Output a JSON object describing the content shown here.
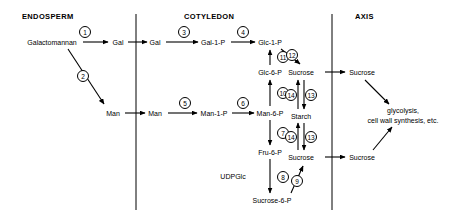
{
  "diagram": {
    "title_bar": {
      "compartments": [
        {
          "id": "endosperm",
          "label": "ENDOSPERM",
          "x": 22,
          "y": 12
        },
        {
          "id": "cotyledon",
          "label": "COTYLEDON",
          "x": 184,
          "y": 12
        },
        {
          "id": "axis",
          "label": "AXIS",
          "x": 355,
          "y": 12
        }
      ]
    },
    "dividers": [
      {
        "id": "endosperm-cotyledon-divider",
        "x": 136,
        "y1": 14,
        "y2": 210
      },
      {
        "id": "cotyledon-axis-divider",
        "x": 332,
        "y1": 14,
        "y2": 210
      }
    ],
    "nodes": [
      {
        "id": "galactomannan",
        "label": "Galactomannan",
        "x": 52,
        "y": 42
      },
      {
        "id": "gal-endosperm",
        "label": "Gal",
        "x": 118,
        "y": 42
      },
      {
        "id": "gal-cotyledon",
        "label": "Gal",
        "x": 155,
        "y": 42
      },
      {
        "id": "gal-1-p",
        "label": "Gal-1-P",
        "x": 213,
        "y": 42
      },
      {
        "id": "glc-1-p",
        "label": "Glc-1-P",
        "x": 270,
        "y": 42
      },
      {
        "id": "man-endosperm",
        "label": "Man",
        "x": 113,
        "y": 113
      },
      {
        "id": "man-cotyledon",
        "label": "Man",
        "x": 155,
        "y": 113
      },
      {
        "id": "man-1-p",
        "label": "Man-1-P",
        "x": 214,
        "y": 113
      },
      {
        "id": "man-6-p",
        "label": "Man-6-P",
        "x": 270,
        "y": 113
      },
      {
        "id": "glc-6-p",
        "label": "Glc-6-P",
        "x": 270,
        "y": 72
      },
      {
        "id": "fru-6-p",
        "label": "Fru-6-P",
        "x": 270,
        "y": 152
      },
      {
        "id": "udpglc",
        "label": "UDPGlc",
        "x": 233,
        "y": 176
      },
      {
        "id": "sucrose-6-p",
        "label": "Sucrose-6-P",
        "x": 272,
        "y": 200
      },
      {
        "id": "sucrose-cotyledon-top",
        "label": "Sucrose",
        "x": 301,
        "y": 72
      },
      {
        "id": "starch",
        "label": "Starch",
        "x": 301,
        "y": 116
      },
      {
        "id": "sucrose-cotyledon-bottom",
        "label": "Sucrose",
        "x": 301,
        "y": 157
      },
      {
        "id": "sucrose-axis-top",
        "label": "Sucrose",
        "x": 362,
        "y": 72
      },
      {
        "id": "sucrose-axis-bottom",
        "label": "Sucrose",
        "x": 362,
        "y": 157
      }
    ],
    "sink_label": {
      "id": "glycolysis-sink",
      "line1": "glycolysis,",
      "line2": "cell wall synthesis, etc.",
      "x": 403,
      "y": 115
    },
    "reactions": [
      {
        "n": "1",
        "x": 85,
        "y": 32
      },
      {
        "n": "2",
        "x": 83,
        "y": 76
      },
      {
        "n": "3",
        "x": 184,
        "y": 32
      },
      {
        "n": "4",
        "x": 243,
        "y": 32
      },
      {
        "n": "5",
        "x": 185,
        "y": 103
      },
      {
        "n": "6",
        "x": 243,
        "y": 103
      },
      {
        "n": "7",
        "x": 283,
        "y": 133
      },
      {
        "n": "8",
        "x": 283,
        "y": 177
      },
      {
        "n": "9",
        "x": 297,
        "y": 181
      },
      {
        "n": "10",
        "x": 283,
        "y": 93
      },
      {
        "n": "11",
        "x": 283,
        "y": 57
      },
      {
        "n": "12",
        "x": 292,
        "y": 55
      },
      {
        "n": "13",
        "x": 311,
        "y": 95
      },
      {
        "n": "14",
        "x": 291,
        "y": 95
      },
      {
        "n": "13b",
        "label": "13",
        "x": 311,
        "y": 137
      },
      {
        "n": "14b",
        "label": "14",
        "x": 291,
        "y": 137
      }
    ]
  },
  "colors": {
    "stroke": "#000000",
    "background": "#ffffff"
  }
}
